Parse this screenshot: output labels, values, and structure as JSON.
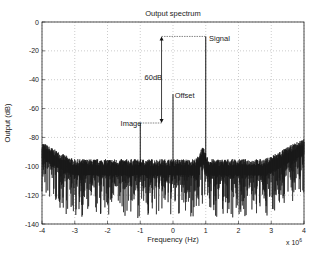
{
  "chart_data": {
    "type": "line",
    "title": "Output spectrum",
    "xlabel": "Frequency (Hz)",
    "ylabel": "Output (dB)",
    "x_multiplier_label": "x 10",
    "x_multiplier_exponent": "6",
    "xlim": [
      -4,
      4
    ],
    "ylim": [
      -140,
      0
    ],
    "xticks": [
      -4,
      -3,
      -2,
      -1,
      0,
      1,
      2,
      3,
      4
    ],
    "yticks": [
      0,
      -20,
      -40,
      -60,
      -80,
      -100,
      -120,
      -140
    ],
    "grid": true,
    "noise_floor_db": -100,
    "peaks": [
      {
        "name": "Signal",
        "x": 1,
        "y": -10
      },
      {
        "name": "Image",
        "x": -1,
        "y": -70
      },
      {
        "name": "Offset",
        "x": 0,
        "y": -50
      }
    ],
    "annotations": [
      {
        "text": "Signal",
        "x": 1.1,
        "y": -13
      },
      {
        "text": "Image",
        "x": -1.6,
        "y": -72
      },
      {
        "text": "Offset",
        "x": 0.05,
        "y": -53
      },
      {
        "text": "60dB",
        "x": -0.6,
        "y": -40
      }
    ],
    "dimension_arrow": {
      "x": -0.35,
      "from": -10,
      "to": -70,
      "label": "60dB"
    }
  }
}
